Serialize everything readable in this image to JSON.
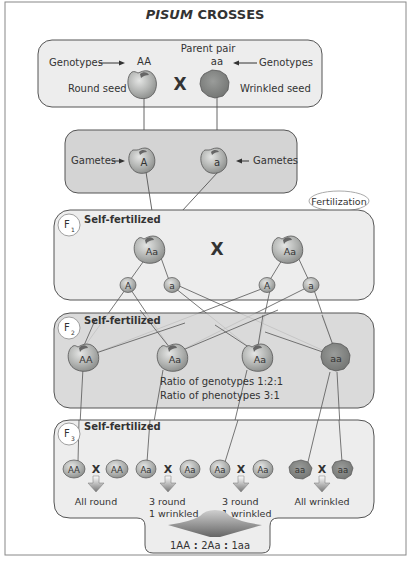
{
  "title": {
    "italic": "PISUM",
    "rest": " CROSSES"
  },
  "parent": {
    "heading": "Parent pair",
    "genotypes_left": "Genotypes",
    "genotypes_right": "Genotypes",
    "round_genotype": "AA",
    "wrinkled_genotype": "aa",
    "round_label": "Round seed",
    "wrinkled_label": "Wrinkled seed",
    "cross": "X"
  },
  "gametes": {
    "left_label": "Gametes",
    "right_label": "Gametes",
    "left_allele": "A",
    "right_allele": "a"
  },
  "fertilization": "Fertilization",
  "f1": {
    "badge_letter": "F",
    "badge_sub": "1",
    "heading": "Self-fertilized",
    "left": "Aa",
    "right": "Aa",
    "cross": "X",
    "gametes": [
      "A",
      "a",
      "A",
      "a"
    ]
  },
  "f2": {
    "badge_letter": "F",
    "badge_sub": "2",
    "heading": "Self-fertilized",
    "seeds": [
      "AA",
      "Aa",
      "Aa",
      "aa"
    ],
    "ratio_genotypes": "Ratio of genotypes 1:2:1",
    "ratio_phenotypes": "Ratio of phenotypes 3:1"
  },
  "f3": {
    "badge_letter": "F",
    "badge_sub": "3",
    "heading": "Self-fertilized",
    "cross": "X",
    "pairs": [
      {
        "a": "AA",
        "b": "AA",
        "line1": "All round",
        "line2": ""
      },
      {
        "a": "Aa",
        "b": "Aa",
        "line1": "3 round",
        "line2": "1 wrinkled"
      },
      {
        "a": "Aa",
        "b": "Aa",
        "line1": "3 round",
        "line2": "1 wrinkled"
      },
      {
        "a": "aa",
        "b": "aa",
        "line1": "All wrinkled",
        "line2": ""
      }
    ],
    "final_ratio": {
      "p1": "1AA",
      "p2": "2Aa",
      "p3": "1aa"
    }
  },
  "colors": {
    "round_seed": "#a8aaa8",
    "wrinkled_seed": "#7e807e",
    "box_light": "#ededed",
    "box_dark": "#d4d4d4",
    "stroke": "#555555"
  }
}
